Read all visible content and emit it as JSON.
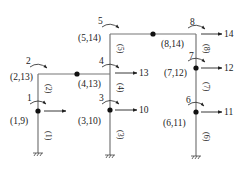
{
  "diagram": {
    "type": "structural-frame-dof-diagram",
    "colors": {
      "member": "#777777",
      "ink": "#222222",
      "background": "#ffffff"
    },
    "joints": [
      {
        "id": 1,
        "label": "(1,9)",
        "rotation_dof": "1",
        "translation_dof": null
      },
      {
        "id": 2,
        "label": "(2,13)",
        "rotation_dof": "2"
      },
      {
        "id": 3,
        "label": "(3,10)",
        "rotation_dof": "3",
        "translation_dof": "10"
      },
      {
        "id": 4,
        "label": "(4,13)",
        "rotation_dof": "4",
        "translation_dof": "13"
      },
      {
        "id": 5,
        "label": "(5,14)",
        "rotation_dof": "5"
      },
      {
        "id": 6,
        "label": "(6,11)",
        "rotation_dof": "6",
        "translation_dof": "11"
      },
      {
        "id": 7,
        "label": "(7,12)",
        "rotation_dof": "7",
        "translation_dof": "12"
      },
      {
        "id": 8,
        "label": "(8,14)",
        "rotation_dof": "8",
        "translation_dof": "14"
      }
    ],
    "members": [
      "(1)",
      "(2)",
      "(3)",
      "(4)",
      "(5)",
      "(6)",
      "(7)",
      "(8)"
    ]
  }
}
